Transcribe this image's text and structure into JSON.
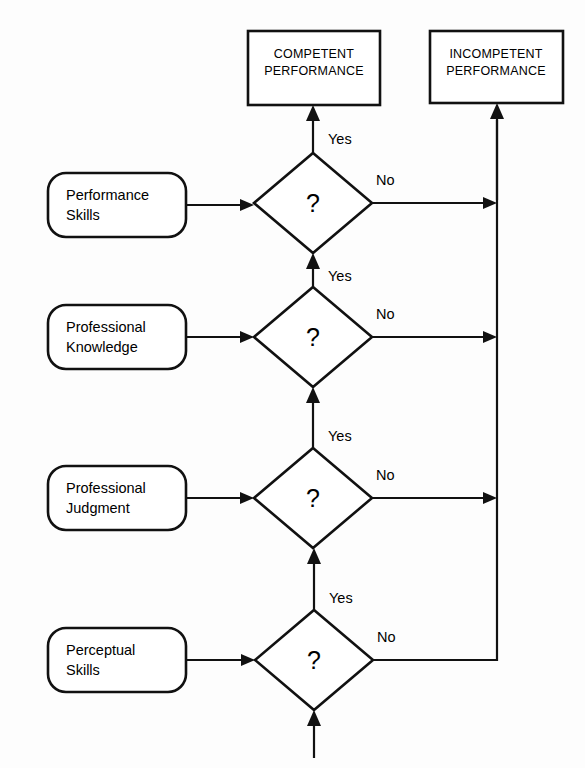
{
  "diagram": {
    "background_color": "#fdfdfd",
    "line_color": "#111111",
    "terminals": [
      {
        "id": "competent",
        "line1": "COMPETENT",
        "line2": "PERFORMANCE"
      },
      {
        "id": "incompetent",
        "line1": "INCOMPETENT",
        "line2": "PERFORMANCE"
      }
    ],
    "inputs": [
      {
        "id": "performance-skills",
        "line1": "Performance",
        "line2": "Skills"
      },
      {
        "id": "professional-knowledge",
        "line1": "Professional",
        "line2": "Knowledge"
      },
      {
        "id": "professional-judgment",
        "line1": "Professional",
        "line2": "Judgment"
      },
      {
        "id": "perceptual-skills",
        "line1": "Perceptual",
        "line2": "Skills"
      }
    ],
    "decisions": [
      {
        "id": "decision-1",
        "symbol": "?",
        "yes_label": "Yes",
        "no_label": "No"
      },
      {
        "id": "decision-2",
        "symbol": "?",
        "yes_label": "Yes",
        "no_label": "No"
      },
      {
        "id": "decision-3",
        "symbol": "?",
        "yes_label": "Yes",
        "no_label": "No"
      },
      {
        "id": "decision-4",
        "symbol": "?",
        "yes_label": "Yes",
        "no_label": "No"
      }
    ]
  }
}
